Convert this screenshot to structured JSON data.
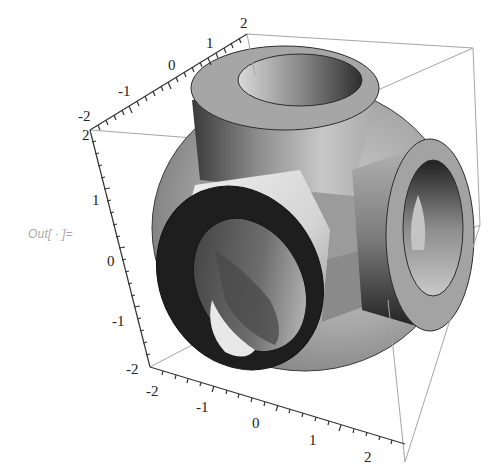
{
  "notebook": {
    "output_label": "Out[ ∙ ]="
  },
  "plot": {
    "type": "3d-graphics",
    "description": "Sphere intersected with cube, with three perpendicular hollow cylindrical bosses",
    "colors": {
      "box_edge": "#9a9a9a",
      "axis": "#333333",
      "surface_light": "#d8d8d8",
      "surface_mid": "#9c9c9c",
      "surface_dark": "#2a2a2a"
    },
    "axes": {
      "top_axis": {
        "ticks": [
          "-2",
          "-1",
          "0",
          "1",
          "2"
        ]
      },
      "left_axis": {
        "ticks": [
          "2",
          "1",
          "0",
          "-1",
          "-2"
        ]
      },
      "bottom_axis": {
        "ticks": [
          "-2",
          "-1",
          "0",
          "1",
          "2"
        ]
      }
    }
  }
}
